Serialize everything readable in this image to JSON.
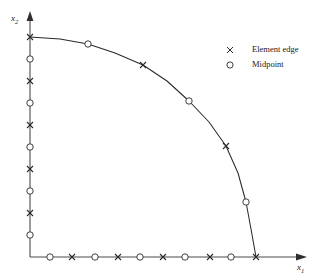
{
  "axes": {
    "xlabel": "x₁",
    "ylabel": "x₂",
    "x_label_plain": "x",
    "x_label_sub": "1",
    "y_label_plain": "x",
    "y_label_sub": "2",
    "axis_color": "#444444",
    "origin_px": [
      30,
      257
    ],
    "x_arrow_tip_px": [
      307,
      257
    ],
    "y_arrow_tip_px": [
      30,
      12
    ]
  },
  "legend": {
    "position": "top-right",
    "items": [
      {
        "marker": "cross-marker",
        "symbol": "×",
        "label": "Element edge"
      },
      {
        "marker": "circle-marker",
        "symbol": "○",
        "label": "Midpoint"
      }
    ]
  },
  "style": {
    "curve_color": "#2a2a2a",
    "marker_color": "#2a2a2a",
    "background": "#ffffff"
  },
  "chart_data": {
    "type": "line",
    "title": "",
    "subtitle": "",
    "xlabel": "x₁",
    "ylabel": "x₂",
    "grid": false,
    "legend_position": "top-right",
    "xlim": [
      0,
      1.25
    ],
    "ylim": [
      0,
      1.25
    ],
    "series": [
      {
        "name": "Boundary curve",
        "type": "line",
        "points_px": [
          [
            30,
            37
          ],
          [
            60,
            39
          ],
          [
            88,
            44
          ],
          [
            115,
            53
          ],
          [
            143,
            65
          ],
          [
            167,
            81
          ],
          [
            189,
            101
          ],
          [
            209,
            122
          ],
          [
            226,
            146
          ],
          [
            238,
            173
          ],
          [
            246,
            202
          ],
          [
            251,
            229
          ],
          [
            256,
            257
          ]
        ]
      },
      {
        "name": "Element edge",
        "type": "scatter",
        "marker": "cross-marker",
        "points_px": [
          [
            30,
            37
          ],
          [
            143,
            65
          ],
          [
            226,
            146
          ],
          [
            256,
            257
          ],
          [
            30,
            81
          ],
          [
            30,
            125
          ],
          [
            30,
            169
          ],
          [
            30,
            213
          ],
          [
            72,
            257
          ],
          [
            118,
            257
          ],
          [
            163,
            257
          ],
          [
            210,
            257
          ]
        ]
      },
      {
        "name": "Midpoint",
        "type": "scatter",
        "marker": "circle-marker",
        "points_px": [
          [
            88,
            44
          ],
          [
            189,
            101
          ],
          [
            246,
            202
          ],
          [
            30,
            59
          ],
          [
            30,
            103
          ],
          [
            30,
            147
          ],
          [
            30,
            191
          ],
          [
            30,
            235
          ],
          [
            50,
            257
          ],
          [
            95,
            257
          ],
          [
            140,
            257
          ],
          [
            185,
            257
          ],
          [
            231,
            257
          ]
        ]
      }
    ]
  }
}
